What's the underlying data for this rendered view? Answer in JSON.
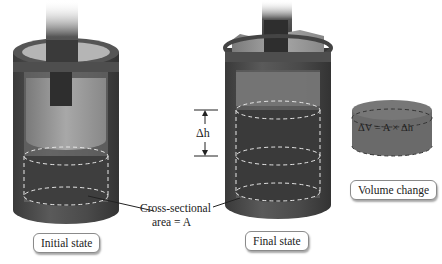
{
  "diagram": {
    "style": "grayscale",
    "colors": {
      "cylinder_wall": "#4a4a4a",
      "cylinder_dark": "#3a3a3a",
      "liquid": "#505050",
      "piston": "#9a9a9a",
      "rod": "#2e2e2e",
      "dashed": "#e6e6e6",
      "label_border": "#8a8a8a"
    },
    "panels": [
      {
        "id": "initial",
        "label": "Initial state"
      },
      {
        "id": "final",
        "label": "Final state"
      },
      {
        "id": "volume",
        "label": "Volume change"
      }
    ],
    "annotations": {
      "cross_section_line1": "Cross-sectional",
      "cross_section_line2": "area = A",
      "delta_h": "Δh",
      "volume_formula": "ΔV = A × Δh"
    }
  }
}
